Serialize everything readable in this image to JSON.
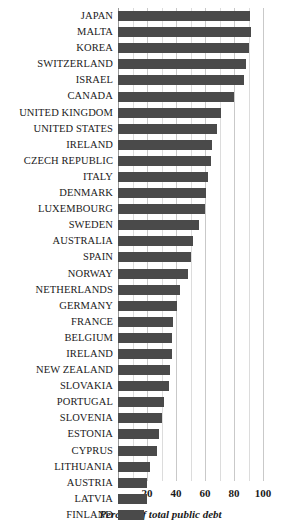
{
  "chart_data": {
    "type": "bar",
    "orientation": "horizontal",
    "title": "",
    "subtitle": "",
    "xlabel": "Percent of total public debt",
    "ylabel": "",
    "xlim": [
      0,
      100
    ],
    "xticks": [
      20,
      40,
      60,
      80,
      100
    ],
    "grid": true,
    "legend": null,
    "bar_color": "#4a4a4a",
    "categories": [
      "JAPAN",
      "MALTA",
      "KOREA",
      "SWITZERLAND",
      "ISRAEL",
      "CANADA",
      "UNITED KINGDOM",
      "UNITED STATES",
      "IRELAND",
      "CZECH REPUBLIC",
      "ITALY",
      "DENMARK",
      "LUXEMBOURG",
      "SWEDEN",
      "AUSTRALIA",
      "SPAIN",
      "NORWAY",
      "NETHERLANDS",
      "GERMANY",
      "FRANCE",
      "BELGIUM",
      "IRELAND",
      "NEW ZEALAND",
      "SLOVAKIA",
      "PORTUGAL",
      "SLOVENIA",
      "ESTONIA",
      "CYPRUS",
      "LITHUANIA",
      "AUSTRIA",
      "LATVIA",
      "FINLAND"
    ],
    "values": [
      91,
      92,
      90,
      88,
      87,
      80,
      71,
      68,
      65,
      64,
      62,
      61,
      60,
      56,
      52,
      50,
      48,
      43,
      41,
      38,
      37,
      37,
      36,
      35,
      32,
      30,
      28,
      27,
      22,
      20,
      20,
      18
    ]
  },
  "axis": {
    "tick_labels": [
      "20",
      "40",
      "60",
      "80",
      "100"
    ],
    "title": "Percent of total public debt"
  }
}
